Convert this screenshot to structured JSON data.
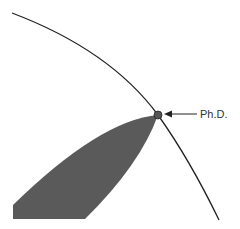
{
  "diagram": {
    "annotation_label": "Ph.D.",
    "colors": {
      "curve": "#222222",
      "region_fill": "#5a5a5a",
      "point_fill": "#555555",
      "arrow": "#222222",
      "background": "#ffffff"
    },
    "elements": [
      {
        "type": "curve",
        "description": "concave arc boundary from top-left to bottom-right"
      },
      {
        "type": "region",
        "description": "dark gray tapered wedge rising from bottom-left to the tip on the curve"
      },
      {
        "type": "point",
        "description": "small dot where wedge tip meets curve"
      },
      {
        "type": "arrow",
        "description": "left-pointing arrow from label to point"
      },
      {
        "type": "label",
        "text": "Ph.D."
      }
    ]
  }
}
